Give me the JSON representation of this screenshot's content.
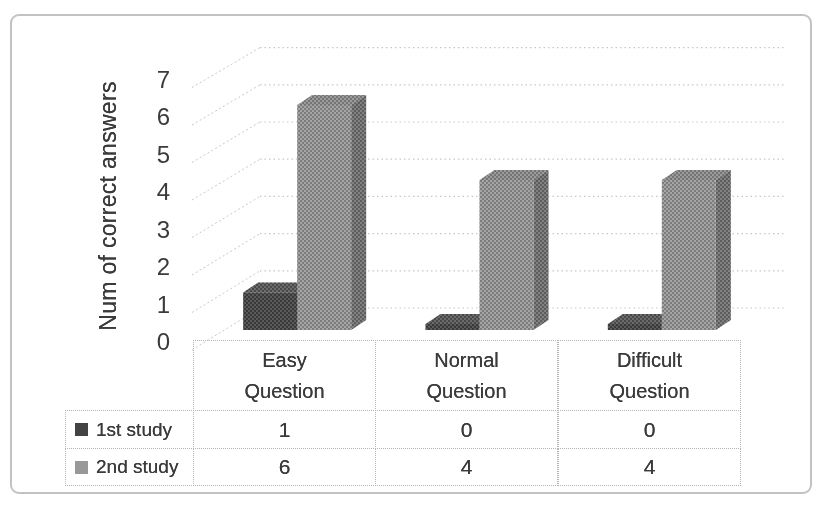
{
  "figure": {
    "background": "#ffffff",
    "border_color": "#c2c2c2"
  },
  "chart_data": {
    "type": "bar",
    "variant": "3d_clustered_column",
    "title": "",
    "xlabel": "",
    "ylabel": "Num of correct answers",
    "categories": [
      "Easy Question",
      "Normal Question",
      "Difficult Question"
    ],
    "series": [
      {
        "name": "1st study",
        "values": [
          1,
          0,
          0
        ],
        "color_front": "#434343",
        "color_top": "#585858",
        "color_side": "#262626"
      },
      {
        "name": "2nd study",
        "values": [
          6,
          4,
          4
        ],
        "color_front": "#989898",
        "color_top": "#8d8d8d",
        "color_side": "#707070"
      }
    ],
    "ylim": [
      0,
      7
    ],
    "yticks": [
      0,
      1,
      2,
      3,
      4,
      5,
      6,
      7
    ],
    "grid": true,
    "gridline_color": "#c7c7c7",
    "axis_text_color": "#3b3b3b",
    "legend_position": "left-of-data-table",
    "show_data_table": true
  }
}
